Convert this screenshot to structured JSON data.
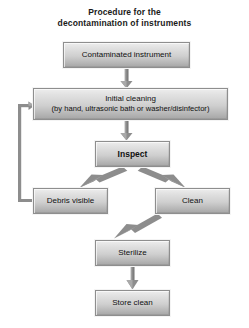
{
  "diagram": {
    "title": {
      "line1": "Procedure for the",
      "line2": "decontamination of instruments"
    },
    "nodes": [
      {
        "id": "contaminated",
        "label": "Contaminated instrument"
      },
      {
        "id": "initial",
        "label": "Initial cleaning",
        "sublabel": "(by hand, ultrasonic bath or washer/disinfector)"
      },
      {
        "id": "inspect",
        "label": "Inspect",
        "emphasis": "bold"
      },
      {
        "id": "debris",
        "label": "Debris visible"
      },
      {
        "id": "clean",
        "label": "Clean"
      },
      {
        "id": "sterilize",
        "label": "Sterilize"
      },
      {
        "id": "store",
        "label": "Store clean"
      }
    ],
    "edges": [
      {
        "from": "contaminated",
        "to": "initial",
        "kind": "arrow-down"
      },
      {
        "from": "initial",
        "to": "inspect",
        "kind": "arrow-down"
      },
      {
        "from": "inspect",
        "to": "debris",
        "kind": "arrow-diagonal-left"
      },
      {
        "from": "inspect",
        "to": "clean",
        "kind": "arrow-diagonal-right"
      },
      {
        "from": "clean",
        "to": "sterilize",
        "kind": "arrow-diagonal-left"
      },
      {
        "from": "sterilize",
        "to": "store",
        "kind": "arrow-down"
      },
      {
        "from": "debris",
        "to": "initial",
        "kind": "feedback-loop-left"
      }
    ],
    "colors": {
      "box_fill_top": "#ededed",
      "box_fill_bottom": "#a6a6a6",
      "box_border": "#8e8e8e",
      "connector": "#888888",
      "text": "#111111",
      "background": "#ffffff"
    }
  }
}
